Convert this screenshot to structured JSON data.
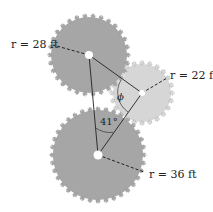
{
  "figure": {
    "gears": [
      {
        "id": "top",
        "label_var": "r",
        "label_value": "28 ft",
        "cx": 89,
        "cy": 55,
        "r": 38,
        "teeth": 30,
        "fill": "#a6a6a6"
      },
      {
        "id": "right",
        "label_var": "r",
        "label_value": "22 ft",
        "cx": 142,
        "cy": 93,
        "r": 29,
        "teeth": 24,
        "fill": "#d6d6d6"
      },
      {
        "id": "bottom",
        "label_var": "r",
        "label_value": "36 ft",
        "cx": 98,
        "cy": 155,
        "r": 45,
        "teeth": 36,
        "fill": "#a6a6a6"
      }
    ],
    "labels": {
      "top": "r = 28 ft",
      "right": "r = 22 ft",
      "bottom": "r = 36 ft",
      "angle_41": "41°",
      "angle_phi": "ϕ"
    },
    "colors": {
      "dark_gear": "#a6a6a6",
      "light_gear": "#d6d6d6",
      "tooth_outline": "#888888",
      "line": "#222222"
    }
  }
}
